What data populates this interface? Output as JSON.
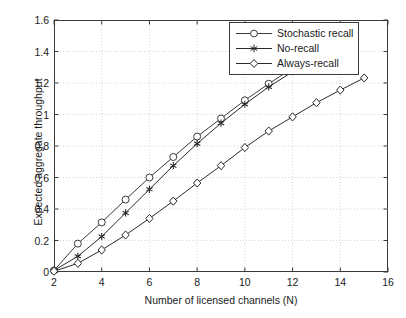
{
  "chart_data": {
    "type": "line",
    "title": "",
    "xlabel": "Number of licensed channels (N)",
    "ylabel": "Expected aggregate throughput",
    "xlim": [
      2,
      16
    ],
    "ylim": [
      0,
      1.6
    ],
    "xticks": [
      2,
      4,
      6,
      8,
      10,
      12,
      14,
      16
    ],
    "yticks": [
      0,
      0.2,
      0.4,
      0.6,
      0.8,
      1,
      1.2,
      1.4,
      1.6
    ],
    "xticklabels": [
      "2",
      "4",
      "6",
      "8",
      "10",
      "12",
      "14",
      "16"
    ],
    "yticklabels": [
      "0",
      "0.2",
      "0.4",
      "0.6",
      "0.8",
      "1",
      "1.2",
      "1.4",
      "1.6"
    ],
    "grid": true,
    "legend_position": "upper right",
    "series": [
      {
        "name": "Stochastic recall",
        "marker": "circle",
        "color": "#3a3a3a",
        "x": [
          2,
          3,
          4,
          5,
          6,
          7,
          8,
          9,
          10,
          11,
          12
        ],
        "y": [
          0.01,
          0.18,
          0.315,
          0.46,
          0.6,
          0.73,
          0.86,
          0.975,
          1.09,
          1.195,
          1.295
        ]
      },
      {
        "name": "No-recall",
        "marker": "asterisk",
        "color": "#2a2a2a",
        "x": [
          2,
          3,
          4,
          5,
          6,
          7,
          8,
          9,
          10,
          11,
          12
        ],
        "y": [
          0.01,
          0.1,
          0.225,
          0.375,
          0.525,
          0.675,
          0.815,
          0.945,
          1.065,
          1.175,
          1.272
        ]
      },
      {
        "name": "Always-recall",
        "marker": "diamond",
        "color": "#2a2a2a",
        "x": [
          2,
          3,
          4,
          5,
          6,
          7,
          8,
          9,
          10,
          11,
          12,
          13,
          14,
          15
        ],
        "y": [
          0.005,
          0.055,
          0.14,
          0.235,
          0.34,
          0.45,
          0.565,
          0.675,
          0.79,
          0.895,
          0.985,
          1.075,
          1.155,
          1.232
        ]
      }
    ]
  },
  "legend": {
    "items": [
      {
        "label": "Stochastic recall"
      },
      {
        "label": "No-recall"
      },
      {
        "label": "Always-recall"
      }
    ]
  }
}
